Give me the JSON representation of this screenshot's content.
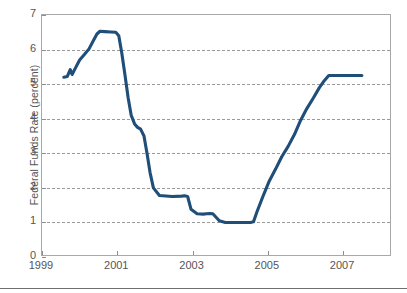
{
  "chart_data": {
    "type": "line",
    "title": "",
    "xlabel": "",
    "ylabel": "Federal Funds Rate (percent)",
    "xlim": [
      1999,
      2008.3
    ],
    "ylim": [
      0,
      7
    ],
    "grid": true,
    "legend": "none",
    "line_color": "#1f4e79",
    "line_width": 3.1,
    "xticks": [
      "1999",
      "2001",
      "2003",
      "2005",
      "2007"
    ],
    "xtick_values": [
      1999,
      2001,
      2003,
      2005,
      2007
    ],
    "yticks": [
      "0",
      "1",
      "2",
      "3",
      "4",
      "5",
      "6",
      "7"
    ],
    "ytick_values": [
      0,
      1,
      2,
      3,
      4,
      5,
      6,
      7
    ],
    "gridline_values": [
      1,
      2,
      3,
      4,
      5,
      6
    ],
    "series": [
      {
        "name": "Federal Funds Rate",
        "x": [
          1999.58,
          1999.67,
          1999.75,
          1999.8,
          1999.88,
          2000.0,
          2000.12,
          2000.25,
          2000.37,
          2000.46,
          2000.54,
          2000.67,
          2000.83,
          2000.96,
          2001.04,
          2001.12,
          2001.2,
          2001.29,
          2001.37,
          2001.46,
          2001.54,
          2001.62,
          2001.71,
          2001.79,
          2001.87,
          2001.96,
          2002.12,
          2002.46,
          2002.71,
          2002.79,
          2002.87,
          2002.96,
          2003.12,
          2003.29,
          2003.37,
          2003.46,
          2003.54,
          2003.71,
          2003.87,
          2004.12,
          2004.37,
          2004.54,
          2004.62,
          2004.71,
          2004.87,
          2005.04,
          2005.21,
          2005.37,
          2005.54,
          2005.71,
          2005.87,
          2006.04,
          2006.21,
          2006.37,
          2006.5,
          2006.62,
          2006.87,
          2007.12,
          2007.37,
          2007.5
        ],
        "y": [
          5.2,
          5.22,
          5.42,
          5.28,
          5.45,
          5.7,
          5.85,
          6.02,
          6.27,
          6.45,
          6.53,
          6.52,
          6.51,
          6.5,
          6.4,
          5.9,
          5.3,
          4.6,
          4.1,
          3.85,
          3.75,
          3.7,
          3.5,
          3.0,
          2.45,
          2.0,
          1.78,
          1.75,
          1.76,
          1.77,
          1.75,
          1.38,
          1.25,
          1.24,
          1.25,
          1.26,
          1.25,
          1.05,
          1.0,
          1.0,
          1.0,
          1.0,
          1.02,
          1.3,
          1.75,
          2.2,
          2.55,
          2.9,
          3.2,
          3.55,
          3.95,
          4.3,
          4.6,
          4.9,
          5.1,
          5.25,
          5.25,
          5.25,
          5.25,
          5.25
        ]
      }
    ],
    "annotations": {
      "peak_value": 6.53,
      "peak_year": 2000.54,
      "trough_value": 1.0,
      "trough_start_year": 2003.87,
      "trough_end_year": 2004.54,
      "final_value": 5.25
    }
  }
}
